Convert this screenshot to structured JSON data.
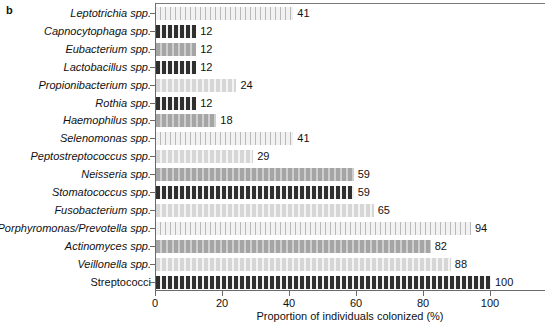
{
  "panel": {
    "letter": "b"
  },
  "chart_data": {
    "type": "bar",
    "orientation": "horizontal",
    "title": "",
    "xlabel": "Proportion of individuals colonized (%)",
    "ylabel": "",
    "xlim": [
      0,
      116
    ],
    "xticks": [
      0,
      20,
      40,
      60,
      80,
      100
    ],
    "xtick_labels": [
      "0",
      "20",
      "40",
      "60",
      "80",
      "100"
    ],
    "grid": false,
    "legend": "none",
    "categories": [
      "Leptotrichia spp.",
      "Capnocytophaga spp.",
      "Eubacterium spp.",
      "Lactobacillus spp.",
      "Propionibacterium spp.",
      "Rothia spp.",
      "Haemophilus spp.",
      "Selenomonas spp.",
      "Peptostreptococcus spp.",
      "Neisseria spp.",
      "Stomatococcus spp.",
      "Fusobacterium spp.",
      "Porphyromonas/Prevotella spp.",
      "Actinomyces spp.",
      "Veillonella spp.",
      "Streptococci"
    ],
    "values": [
      41,
      12,
      12,
      12,
      24,
      12,
      18,
      41,
      29,
      59,
      59,
      65,
      94,
      82,
      88,
      100
    ],
    "value_labels": [
      "41",
      "12",
      "12",
      "12",
      "24",
      "12",
      "18",
      "41",
      "29",
      "59",
      "59",
      "65",
      "94",
      "82",
      "88",
      "100"
    ],
    "label_styles": [
      "italic",
      "italic",
      "italic",
      "italic",
      "italic",
      "italic",
      "italic",
      "italic",
      "italic",
      "italic",
      "italic",
      "italic",
      "italic",
      "italic",
      "italic",
      "roman"
    ],
    "fill_patterns": [
      "a",
      "d",
      "c",
      "d",
      "b",
      "d",
      "c",
      "a",
      "b",
      "c",
      "d",
      "b",
      "a",
      "c",
      "b",
      "d"
    ],
    "pattern_colors": {
      "a": "#f2f2f2",
      "b": "#d6d6d6",
      "c": "#a5a5a5",
      "d": "#2f2f2f"
    }
  }
}
